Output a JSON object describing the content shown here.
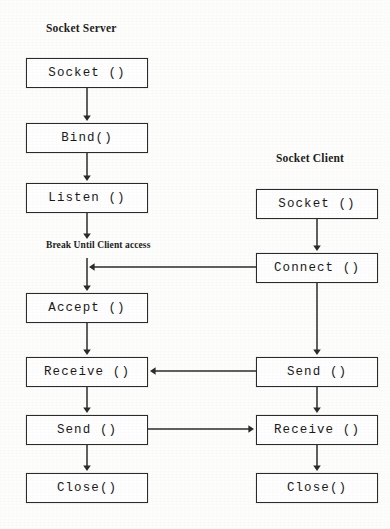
{
  "diagram": {
    "background_color": "#fdfdfb",
    "line_color": "#2b2b2b",
    "box_fill": "#fefefe",
    "columns": [
      {
        "id": "server",
        "heading": "Socket Server",
        "nodes": [
          {
            "id": "server-socket",
            "label": "Socket ()"
          },
          {
            "id": "server-bind",
            "label": "Bind()"
          },
          {
            "id": "server-listen",
            "label": "Listen ()"
          },
          {
            "id": "server-accept",
            "label": "Accept ()"
          },
          {
            "id": "server-receive",
            "label": "Receive ()"
          },
          {
            "id": "server-send",
            "label": "Send ()"
          },
          {
            "id": "server-close",
            "label": "Close()"
          }
        ]
      },
      {
        "id": "client",
        "heading": "Socket Client",
        "nodes": [
          {
            "id": "client-socket",
            "label": "Socket ()"
          },
          {
            "id": "client-connect",
            "label": "Connect ()"
          },
          {
            "id": "client-send",
            "label": "Send ()"
          },
          {
            "id": "client-receive",
            "label": "Receive ()"
          },
          {
            "id": "client-close",
            "label": "Close()"
          }
        ]
      }
    ],
    "annotations": [
      {
        "id": "break-note",
        "text": "Break Until Client access"
      }
    ],
    "edges": [
      {
        "id": "edge-server-socket-bind",
        "from": "server-socket",
        "to": "server-bind",
        "direction": "down"
      },
      {
        "id": "edge-server-bind-listen",
        "from": "server-bind",
        "to": "server-listen",
        "direction": "down"
      },
      {
        "id": "edge-server-listen-accept",
        "from": "server-listen",
        "to": "server-accept",
        "direction": "down"
      },
      {
        "id": "edge-server-accept-receive",
        "from": "server-accept",
        "to": "server-receive",
        "direction": "down"
      },
      {
        "id": "edge-server-receive-send",
        "from": "server-receive",
        "to": "server-send",
        "direction": "down"
      },
      {
        "id": "edge-server-send-close",
        "from": "server-send",
        "to": "server-close",
        "direction": "down"
      },
      {
        "id": "edge-client-socket-connect",
        "from": "client-socket",
        "to": "client-connect",
        "direction": "down"
      },
      {
        "id": "edge-client-connect-send",
        "from": "client-connect",
        "to": "client-send",
        "direction": "down"
      },
      {
        "id": "edge-client-send-receive",
        "from": "client-send",
        "to": "client-receive",
        "direction": "down"
      },
      {
        "id": "edge-client-receive-close",
        "from": "client-receive",
        "to": "client-close",
        "direction": "down"
      },
      {
        "id": "edge-connect-to-server-spine",
        "from": "client-connect",
        "to": "server-accept",
        "direction": "left"
      },
      {
        "id": "edge-client-send-to-server-receive",
        "from": "client-send",
        "to": "server-receive",
        "direction": "left"
      },
      {
        "id": "edge-server-send-to-client-receive",
        "from": "server-send",
        "to": "client-receive",
        "direction": "right"
      }
    ]
  }
}
